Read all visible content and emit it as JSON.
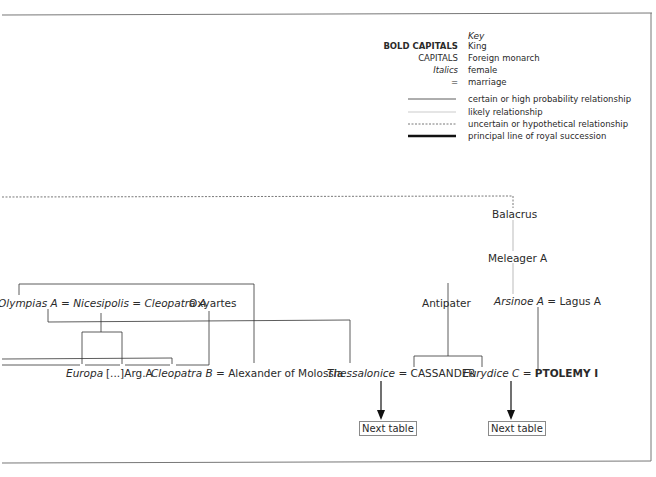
{
  "key": {
    "title": "Key",
    "rows": [
      {
        "label": "BOLD CAPITALS",
        "desc": "King"
      },
      {
        "label": "CAPITALS",
        "desc": "Foreign monarch"
      },
      {
        "label": "Italics",
        "desc": "female"
      },
      {
        "label": "=",
        "desc": "marriage"
      },
      {
        "label": "",
        "desc": "certain or high probability relationship"
      },
      {
        "label": "",
        "desc": "likely relationship"
      },
      {
        "label": "",
        "desc": "uncertain or hypothetical relationship"
      },
      {
        "label": "",
        "desc": "principal line of royal succession"
      }
    ]
  },
  "people": {
    "olympias": "Olympias A",
    "nicesipolis": "Nicesipolis",
    "cleopatra_a": "Cleopatra A",
    "oxyartes": "Oxyartes",
    "europa": "Europa",
    "arg_a": "[...]Arg.A",
    "cleopatra_b": "Cleopatra B",
    "alexander_molossia": "Alexander of Molossia",
    "thessalonice": "Thessalonice",
    "cassander": "CASSANDER",
    "antipater": "Antipater",
    "eurydice_c": "Eurydice C",
    "ptolemy_i": "PTOLEMY I",
    "balacrus": "Balacrus",
    "meleager_a": "Meleager A",
    "arsinoe_a": "Arsinoe A",
    "lagus_a": "Lagus A"
  },
  "marriage_sign": "=",
  "next_table": "Next table"
}
